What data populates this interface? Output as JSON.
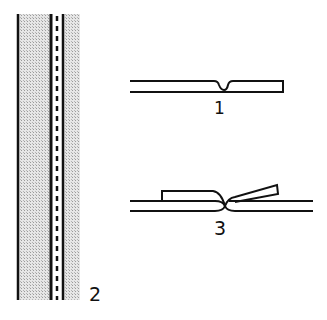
{
  "figures": [
    {
      "id": "fig-2",
      "label": "2",
      "description": "Shaded strip with double stitched seam line (top view)"
    },
    {
      "id": "fig-1",
      "label": "1",
      "description": "Flat seam cross-section with V-notch"
    },
    {
      "id": "fig-3",
      "label": "3",
      "description": "Seam cross-section with folded allowances pressed open"
    }
  ],
  "colors": {
    "ink": "#111111",
    "shade": "#c8c8c8",
    "background": "#ffffff"
  }
}
